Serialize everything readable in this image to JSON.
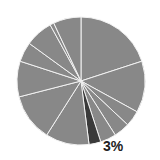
{
  "chart_data": {
    "type": "pie",
    "title": "",
    "center": [
      81,
      81
    ],
    "radius": 64,
    "start_angle_deg": 0,
    "slice_colors": {
      "default": "#888888",
      "highlight": "#3a3a3a",
      "separator": "#f2f2f2"
    },
    "slices": [
      {
        "label": "",
        "value": 20,
        "highlight": false
      },
      {
        "label": "",
        "value": 13,
        "highlight": false
      },
      {
        "label": "",
        "value": 4,
        "highlight": false
      },
      {
        "label": "",
        "value": 4,
        "highlight": false
      },
      {
        "label": "",
        "value": 4,
        "highlight": false
      },
      {
        "label": "3%",
        "value": 3,
        "highlight": true
      },
      {
        "label": "",
        "value": 11,
        "highlight": false
      },
      {
        "label": "",
        "value": 12,
        "highlight": false
      },
      {
        "label": "",
        "value": 9,
        "highlight": false
      },
      {
        "label": "",
        "value": 5,
        "highlight": false
      },
      {
        "label": "",
        "value": 7,
        "highlight": false
      },
      {
        "label": "",
        "value": 1,
        "highlight": false
      },
      {
        "label": "",
        "value": 7,
        "highlight": false
      }
    ],
    "annotations": [
      {
        "text": "3%",
        "slice_index": 5
      }
    ]
  }
}
